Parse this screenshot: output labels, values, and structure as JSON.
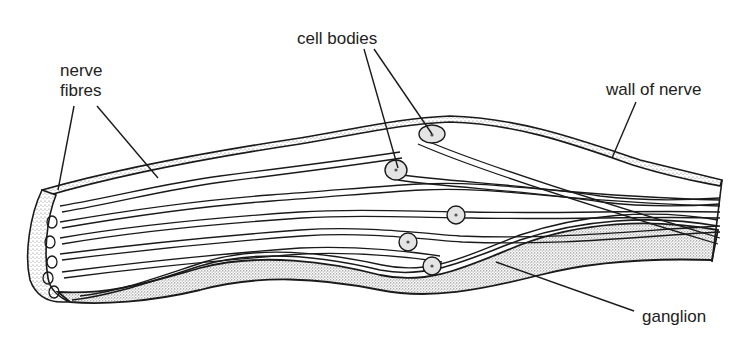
{
  "diagram": {
    "labels": {
      "nerve_fibres_line1": "nerve",
      "nerve_fibres_line2": "fibres",
      "cell_bodies": "cell bodies",
      "wall_of_nerve": "wall of nerve",
      "ganglion": "ganglion"
    },
    "colors": {
      "ink": "#1a1a1a",
      "stipple": "#9a9a9a",
      "cell_fill": "#e4e4e4",
      "background": "#ffffff"
    }
  }
}
